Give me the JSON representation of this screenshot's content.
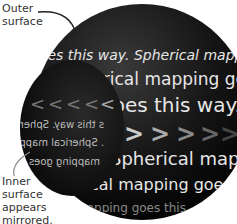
{
  "labels": {
    "outer": [
      "Outer",
      "surface"
    ],
    "inner": [
      "Inner",
      "surface",
      "appears",
      "mirrored."
    ]
  },
  "sphere_text": {
    "line1": "goes this way. Spherical mapping",
    "line2": "Spherical mapping goes this",
    "line3": "goes this way. Sphe",
    "line4": "Spherical mapp",
    "line5": "cal mapping goes",
    "line6": "mapping goes this"
  },
  "inner_text": {
    "line1": "s this way. Spherical",
    "line2": ". Spherical mapp",
    "line3": "mapping goes"
  },
  "colors": {
    "sphere_dark": "#111111",
    "text_light": "#e6e6e6",
    "arrow_color": "#bbbbbb"
  }
}
